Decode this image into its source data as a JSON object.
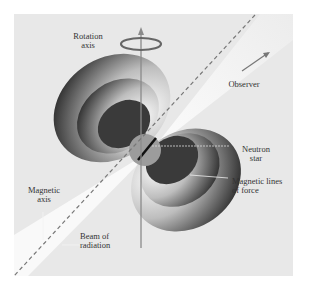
{
  "diagram": {
    "labels": {
      "rotation_axis": [
        "Rotation",
        "axis"
      ],
      "observer": "Observer",
      "neutron_star": [
        "Neutron",
        "star"
      ],
      "magnetic_lines": [
        "Magnetic lines",
        "of force"
      ],
      "magnetic_axis": [
        "Magnetic",
        "axis"
      ],
      "beam": [
        "Beam of",
        "radiation"
      ]
    },
    "colors": {
      "background": "#e6e6e6",
      "beam": "#f6f6f6",
      "lobe_dark": "#3a3a3a",
      "lobe_light": "#f0f0f0",
      "star": "#9a9a9a",
      "axis": "#8a8a8a",
      "ring": "#666666"
    }
  }
}
